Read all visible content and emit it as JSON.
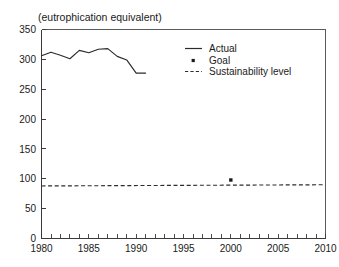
{
  "header": {
    "faint_top_text": "",
    "subtitle": "(eutrophication equivalent)"
  },
  "legend": {
    "position": "top-right",
    "entries": [
      {
        "label": "Actual",
        "symbol": "solid-line"
      },
      {
        "label": "Goal",
        "symbol": "square-dot"
      },
      {
        "label": "Sustainability level",
        "symbol": "dashed-line"
      }
    ]
  },
  "axes": {
    "y_ticks": [
      "0",
      "50",
      "100",
      "150",
      "200",
      "250",
      "300",
      "350"
    ],
    "x_ticks": [
      "1980",
      "1985",
      "1990",
      "1995",
      "2000",
      "2005",
      "2010"
    ]
  },
  "chart_data": {
    "type": "line",
    "title": "(eutrophication equivalent)",
    "xlabel": "",
    "ylabel": "",
    "xlim": [
      1980,
      2010
    ],
    "ylim": [
      0,
      350
    ],
    "yticks": [
      0,
      50,
      100,
      150,
      200,
      250,
      300,
      350
    ],
    "xticks": [
      1980,
      1985,
      1990,
      1995,
      2000,
      2005,
      2010
    ],
    "x_minor_tick_interval": 1,
    "grid": false,
    "legend_position": "upper right",
    "series": [
      {
        "name": "Actual",
        "type": "line",
        "style": "solid",
        "x": [
          1980,
          1981,
          1982,
          1983,
          1984,
          1985,
          1986,
          1987,
          1988,
          1989,
          1990,
          1991
        ],
        "values": [
          306,
          312,
          307,
          301,
          315,
          311,
          317,
          318,
          305,
          299,
          277,
          277
        ]
      },
      {
        "name": "Goal",
        "type": "scatter",
        "style": "square-marker",
        "x": [
          2000
        ],
        "values": [
          98
        ]
      },
      {
        "name": "Sustainability level",
        "type": "line",
        "style": "dashed",
        "x": [
          1980,
          2010
        ],
        "values": [
          88,
          90
        ]
      }
    ]
  }
}
